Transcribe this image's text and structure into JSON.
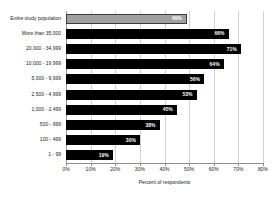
{
  "chart_data": {
    "type": "bar",
    "orientation": "horizontal",
    "title": "",
    "xlabel": "Percent of respondents",
    "ylabel": "",
    "xlim": [
      0,
      80
    ],
    "xtick_labels": [
      "0%",
      "10%",
      "20%",
      "30%",
      "40%",
      "50%",
      "60%",
      "70%",
      "80%"
    ],
    "xticks": [
      0,
      10,
      20,
      30,
      40,
      50,
      60,
      70,
      80
    ],
    "grid": true,
    "legend": "none",
    "categories": [
      "Entire study population",
      "More than 35,000",
      "20,000 - 34,999",
      "10,000 - 19,999",
      "5,000 - 9,999",
      "2,500 - 4,999",
      "1,000 - 2,499",
      "500 - 999",
      "100 - 499",
      "1 - 99"
    ],
    "values": [
      49,
      66,
      71,
      64,
      56,
      53,
      45,
      38,
      30,
      19
    ],
    "value_labels": [
      "49%",
      "66%",
      "71%",
      "64%",
      "56%",
      "53%",
      "45%",
      "38%",
      "30%",
      "19%"
    ],
    "bar_colors": [
      "#a0a0a0",
      "#000000",
      "#000000",
      "#000000",
      "#000000",
      "#000000",
      "#000000",
      "#000000",
      "#000000",
      "#000000"
    ],
    "highlight_index": 0,
    "colors": {
      "bar_default": "#000000",
      "bar_highlight": "#a0a0a0",
      "bar_highlight_border": "#3c3c3c",
      "value_text": "#ffffff",
      "grid": "#d2d2d2",
      "axis": "#8c8c8c",
      "text": "#1a1a1a",
      "background": "#ffffff"
    }
  }
}
